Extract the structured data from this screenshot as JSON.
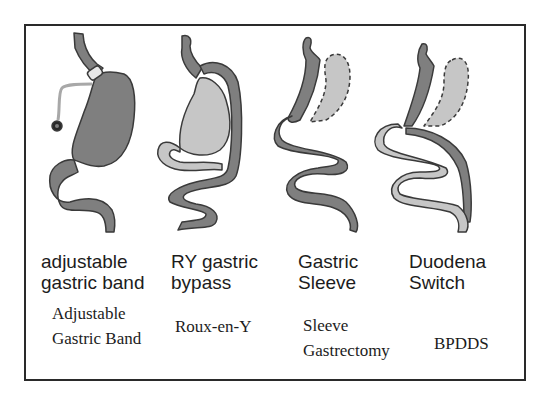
{
  "colors": {
    "dark_gray": "#7f7f7f",
    "light_gray": "#c6c6c6",
    "outline": "#3a3a3a",
    "border": "#2a2a2a"
  },
  "procedures": [
    {
      "id": "band",
      "label_line1": "adjustable",
      "label_line2": "gastric band",
      "name_line1": "Adjustable",
      "name_line2": "Gastric Band"
    },
    {
      "id": "bypass",
      "label_line1": "RY gastric",
      "label_line2": "bypass",
      "name_line1": "Roux-en-Y",
      "name_line2": ""
    },
    {
      "id": "sleeve",
      "label_line1": "Gastric",
      "label_line2": "Sleeve",
      "name_line1": "Sleeve",
      "name_line2": "Gastrectomy"
    },
    {
      "id": "switch",
      "label_line1": "Duodena",
      "label_line2": "Switch",
      "name_line1": "BPDDS",
      "name_line2": ""
    }
  ]
}
